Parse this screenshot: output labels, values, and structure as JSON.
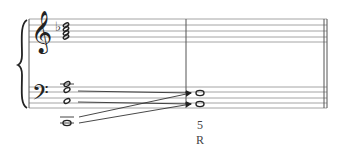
{
  "score": {
    "treble_clef": "𝄞",
    "bass_clef": "𝄢",
    "key_accidental": "♭",
    "measure_number": "5",
    "annotation": "R",
    "colors": {
      "staff": "#9a9a9a",
      "ink": "#222222",
      "text": "#444444"
    }
  }
}
